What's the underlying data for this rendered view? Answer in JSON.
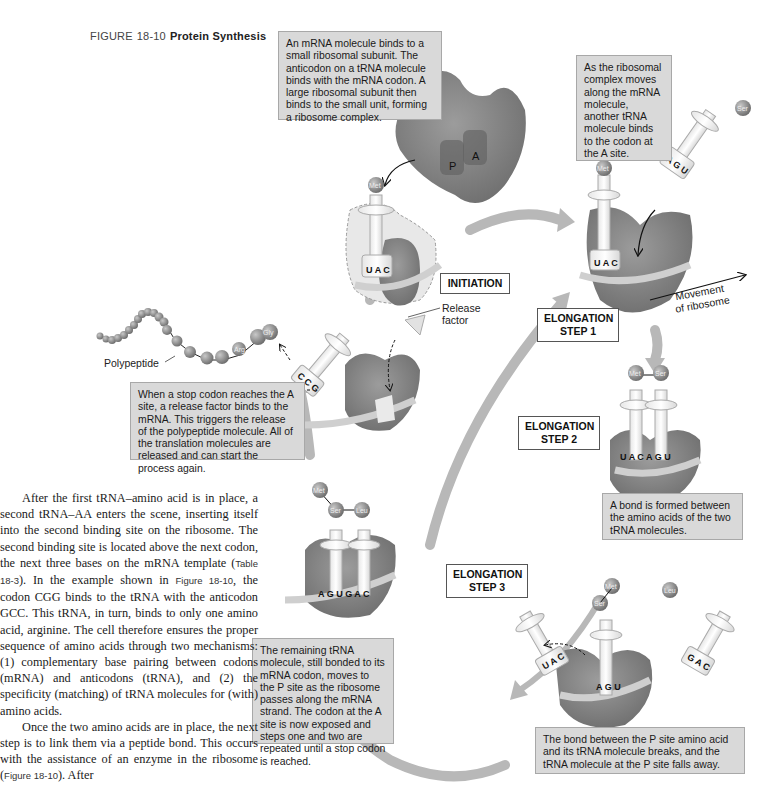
{
  "figure": {
    "label": "FIGURE",
    "number": "18-10",
    "title": "Protein Synthesis"
  },
  "boxes": {
    "initiation": "An mRNA molecule binds to a small ribosomal subunit. The anticodon on a tRNA molecule binds with the mRNA codon. A large ribosomal subunit then binds to the small unit, forming a ribosome complex.",
    "elongation1": "As the ribosomal complex moves along the mRNA molecule, another tRNA molecule binds to the codon at the A site.",
    "termination": "When a stop codon reaches the A site, a release factor binds to the mRNA. This triggers the release of the polypeptide molecule. All of the translation molecules are released and can start the process again.",
    "elongation2": "A bond is formed between the amino acids of the two tRNA molecules.",
    "elongation3": "The remaining tRNA molecule, still bonded to its mRNA codon, moves to the P site as the ribosome passes along the mRNA strand. The codon at the A site is now exposed and steps one and two are repeated until a stop codon is reached.",
    "bond_break": "The bond between the P site amino acid and its tRNA molecule breaks, and the tRNA molecule at the P site falls away."
  },
  "stages": {
    "initiation": "INITIATION",
    "elong1_line1": "ELONGATION",
    "elong1_line2": "STEP 1",
    "elong2_line1": "ELONGATION",
    "elong2_line2": "STEP 2",
    "elong3_line1": "ELONGATION",
    "elong3_line2": "STEP 3"
  },
  "labels": {
    "polypeptide": "Polypeptide",
    "release_factor_1": "Release",
    "release_factor_2": "factor",
    "movement_1": "Movement",
    "movement_2": "of ribosome",
    "p_site": "P",
    "a_site": "A"
  },
  "amino_acids": {
    "met": "Met",
    "ser": "Ser",
    "leu": "Leu",
    "arg": "Arg",
    "gly": "Gly"
  },
  "codons": {
    "uac": [
      "U",
      "A",
      "C"
    ],
    "agu": [
      "A",
      "G",
      "U"
    ],
    "gac": [
      "G",
      "A",
      "C"
    ],
    "ccg": [
      "C",
      "C",
      "G"
    ],
    "uacagu": "U A C A G U",
    "agugac": "A G U G A C"
  },
  "body_text": {
    "p1_a": "After the first tRNA–amino acid is in place, a second tRNA–AA enters the scene, inserting itself into the second binding site on the ribosome. The second binding site is located above the next codon, the next three bases on the mRNA template (",
    "p1_ref1": "Table 18-3",
    "p1_b": "). In the example shown in ",
    "p1_ref2": "Figure 18-10",
    "p1_c": ", the codon CGG binds to the tRNA with the anticodon GCC. This tRNA, in turn, binds to only one amino acid, arginine. The cell therefore ensures the proper sequence of amino acids through two mechanisms: (1) complementary base pairing between codons (mRNA) and anticodons (tRNA), and (2) the specificity (matching) of tRNA molecules for (with) amino acids.",
    "p2_a": "Once the two amino acids are in place, the next step is to link them via a peptide bond. This occurs with the assistance of an enzyme in the ribosome (",
    "p2_ref": "Figure 18-10",
    "p2_b": "). After"
  },
  "colors": {
    "ribosome": "#8a8a8a",
    "ribosome_dark": "#6e6e6e",
    "trna": "#f2f2f2",
    "box_bg": "#d9d9d9",
    "arrow": "#b5b5b5",
    "amino_acid": "#7a7a7a"
  }
}
